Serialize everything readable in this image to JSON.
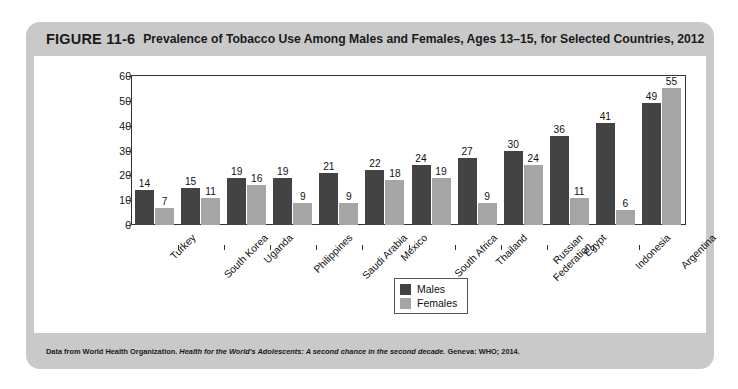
{
  "figure": {
    "number": "FIGURE 11-6",
    "title": "Prevalence of Tobacco Use Among Males and Females, Ages 13–15, for Selected Countries, 2012",
    "source_prefix": "Data from World Health Organization. ",
    "source_italic": "Health for the World's Adolescents: A second chance in the second decade.",
    "source_suffix": " Geneva: WHO; 2014."
  },
  "colors": {
    "males": "#434343",
    "females": "#a5a5a5",
    "card": "#c9c9c9",
    "plot_background": "#ffffff",
    "axis": "#333333"
  },
  "chart_data": {
    "type": "bar",
    "title": "Prevalence of Tobacco Use Among Males and Females, Ages 13–15, for Selected Countries, 2012",
    "xlabel": "",
    "ylabel_line1": "Percentage (%) currently",
    "ylabel_line2": "using any form of tobacco",
    "ylim": [
      0,
      60
    ],
    "yticks": [
      0,
      10,
      20,
      30,
      40,
      50,
      60
    ],
    "grid": false,
    "legend_position": "bottom-center",
    "categories": [
      "Turkey",
      "South Korea",
      "Uganda",
      "Philippines",
      "Saudi Arabia",
      "Mexico",
      "South Africa",
      "Thailand",
      "Russian Federation",
      "Egypt",
      "Indonesia",
      "Argentina"
    ],
    "category_lines": [
      [
        "Turkey"
      ],
      [
        "South Korea"
      ],
      [
        "Uganda"
      ],
      [
        "Philippines"
      ],
      [
        "Saudi Arabia"
      ],
      [
        "Mexico"
      ],
      [
        "South Africa"
      ],
      [
        "Thailand"
      ],
      [
        "Russian",
        "Federation"
      ],
      [
        "Egypt"
      ],
      [
        "Indonesia"
      ],
      [
        "Argentina"
      ]
    ],
    "series": [
      {
        "name": "Males",
        "values": [
          14,
          15,
          19,
          19,
          21,
          22,
          24,
          27,
          30,
          36,
          41,
          49
        ]
      },
      {
        "name": "Females",
        "values": [
          7,
          11,
          16,
          9,
          9,
          18,
          19,
          9,
          24,
          11,
          6,
          55
        ]
      }
    ]
  },
  "legend": {
    "items": [
      {
        "label": "Males",
        "color": "#434343"
      },
      {
        "label": "Females",
        "color": "#a5a5a5"
      }
    ]
  }
}
